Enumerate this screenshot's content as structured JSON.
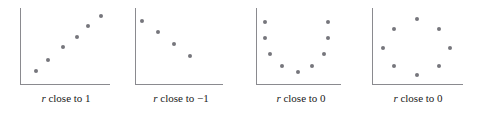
{
  "figure": {
    "width": 477,
    "height": 116,
    "background": "#ffffff",
    "dot_color": "#76767c",
    "axis_color": "#8a8a8f"
  },
  "chart_data": [
    {
      "type": "scatter",
      "title": "",
      "caption_var": "r",
      "caption_text": " close to 1",
      "caption_full": "r close to 1",
      "xlabel": "",
      "ylabel": "",
      "grid": false,
      "legend": "none",
      "xlim": [
        0,
        100
      ],
      "ylim": [
        0,
        100
      ],
      "points": [
        {
          "x": 18,
          "y": 17
        },
        {
          "x": 31,
          "y": 32
        },
        {
          "x": 48,
          "y": 49
        },
        {
          "x": 63,
          "y": 62
        },
        {
          "x": 76,
          "y": 76
        },
        {
          "x": 90,
          "y": 90
        }
      ]
    },
    {
      "type": "scatter",
      "title": "",
      "caption_var": "r",
      "caption_text": " close to −1",
      "caption_full": "r close to −1",
      "xlabel": "",
      "ylabel": "",
      "grid": false,
      "legend": "none",
      "xlim": [
        0,
        100
      ],
      "ylim": [
        0,
        100
      ],
      "points": [
        {
          "x": 8,
          "y": 83
        },
        {
          "x": 26,
          "y": 68
        },
        {
          "x": 44,
          "y": 52
        },
        {
          "x": 62,
          "y": 37
        }
      ]
    },
    {
      "type": "scatter",
      "title": "",
      "caption_var": "r",
      "caption_text": " close to 0",
      "caption_full": "r close to 0",
      "xlabel": "",
      "ylabel": "",
      "grid": false,
      "legend": "none",
      "xlim": [
        0,
        100
      ],
      "ylim": [
        0,
        100
      ],
      "points": [
        {
          "x": 10,
          "y": 82
        },
        {
          "x": 10,
          "y": 60
        },
        {
          "x": 16,
          "y": 40
        },
        {
          "x": 31,
          "y": 24
        },
        {
          "x": 49,
          "y": 16
        },
        {
          "x": 66,
          "y": 24
        },
        {
          "x": 80,
          "y": 40
        },
        {
          "x": 85,
          "y": 60
        },
        {
          "x": 85,
          "y": 82
        }
      ]
    },
    {
      "type": "scatter",
      "title": "",
      "caption_var": "r",
      "caption_text": " close to 0",
      "caption_full": "r close to 0",
      "xlabel": "",
      "ylabel": "",
      "grid": false,
      "legend": "none",
      "xlim": [
        0,
        100
      ],
      "ylim": [
        0,
        100
      ],
      "points": [
        {
          "x": 49,
          "y": 86
        },
        {
          "x": 24,
          "y": 72
        },
        {
          "x": 74,
          "y": 72
        },
        {
          "x": 12,
          "y": 48
        },
        {
          "x": 86,
          "y": 48
        },
        {
          "x": 24,
          "y": 24
        },
        {
          "x": 74,
          "y": 24
        },
        {
          "x": 49,
          "y": 12
        }
      ]
    }
  ],
  "panels": [
    {
      "left": 6,
      "plot_left": 14,
      "plot_top": 8,
      "plot_width": 90,
      "plot_height": 76,
      "caption_top": 92,
      "caption_width": 120
    },
    {
      "left": 122,
      "plot_left": 13,
      "plot_top": 8,
      "plot_width": 88,
      "plot_height": 76,
      "caption_top": 92,
      "caption_width": 118
    },
    {
      "left": 243,
      "plot_left": 13,
      "plot_top": 8,
      "plot_width": 85,
      "plot_height": 76,
      "caption_top": 92,
      "caption_width": 116
    },
    {
      "left": 358,
      "plot_left": 14,
      "plot_top": 8,
      "plot_width": 91,
      "plot_height": 76,
      "caption_top": 92,
      "caption_width": 120
    }
  ]
}
